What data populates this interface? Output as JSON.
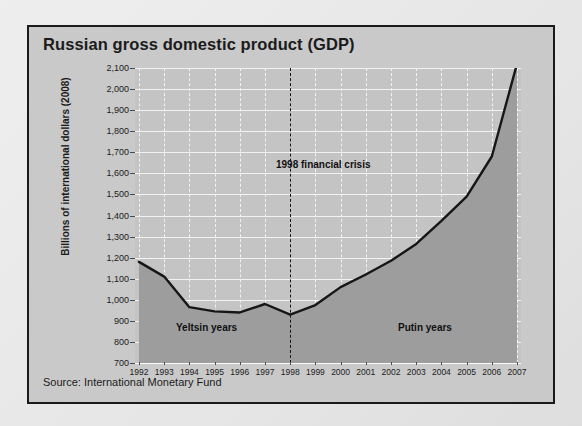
{
  "card": {
    "title": "Russian gross domestic product (GDP)",
    "source": "Source: International Monetary Fund"
  },
  "chart_data": {
    "type": "area",
    "title": "Russian gross domestic product (GDP)",
    "xlabel": "",
    "ylabel": "Billions of international dollars (2008)",
    "x": [
      1992,
      1993,
      1994,
      1995,
      1996,
      1997,
      1998,
      1999,
      2000,
      2001,
      2002,
      2003,
      2004,
      2005,
      2006,
      2007
    ],
    "categories": [
      "1992",
      "1993",
      "1994",
      "1995",
      "1996",
      "1997",
      "1998",
      "1999",
      "2000",
      "2001",
      "2002",
      "2003",
      "2004",
      "2005",
      "2006",
      "2007"
    ],
    "values": [
      1180,
      1110,
      965,
      945,
      940,
      980,
      930,
      975,
      1060,
      1120,
      1185,
      1265,
      1375,
      1490,
      1680,
      2120
    ],
    "series": [
      {
        "name": "Russian GDP",
        "values": [
          1180,
          1110,
          965,
          945,
          940,
          980,
          930,
          975,
          1060,
          1120,
          1185,
          1265,
          1375,
          1490,
          1680,
          2120
        ]
      }
    ],
    "ylim": [
      700,
      2100
    ],
    "yticks": [
      700,
      800,
      900,
      1000,
      1100,
      1200,
      1300,
      1400,
      1500,
      1600,
      1700,
      1800,
      1900,
      2000,
      2100
    ],
    "ytick_labels": [
      "700",
      "800",
      "900",
      "1,000",
      "1,100",
      "1,200",
      "1,300",
      "1,400",
      "1,500",
      "1,600",
      "1,700",
      "1,800",
      "1,900",
      "2,000",
      "2,100"
    ],
    "grid": true,
    "legend": "none",
    "annotations": [
      {
        "id": "crisis",
        "text": "1998 financial crisis",
        "x": 1998,
        "marker": "dashed-vertical-line"
      },
      {
        "id": "yeltsin",
        "text": "Yeltsin years"
      },
      {
        "id": "putin",
        "text": "Putin years"
      }
    ],
    "colors": {
      "plot_background": "#c4c4c4",
      "area_fill": "#9d9d9d",
      "line": "#161616",
      "gridline": "#f2f2f2",
      "card_background": "#c9c9c9",
      "text": "#1b1b1b"
    }
  }
}
